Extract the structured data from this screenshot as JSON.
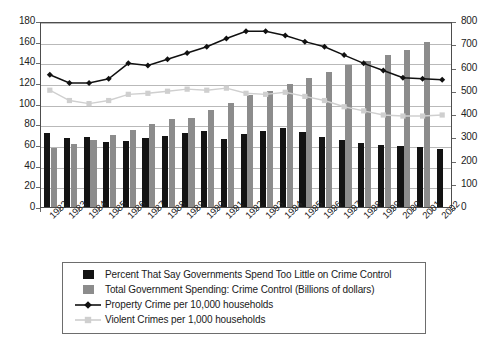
{
  "chart_data": {
    "type": "bar",
    "title": "",
    "subtitle": "",
    "xlabel": "",
    "ylabel": "",
    "grid": true,
    "legend_position": "bottom",
    "categories": [
      "1982",
      "1983",
      "1984",
      "1985",
      "1986",
      "1987",
      "1988",
      "1989",
      "1990",
      "1991",
      "1992",
      "1993",
      "1994",
      "1995",
      "1996",
      "1997",
      "1998",
      "1999",
      "2000",
      "2001",
      "2002"
    ],
    "axes": {
      "left": {
        "min": 0,
        "max": 180,
        "step": 20,
        "ticks": [
          "0",
          "20",
          "40",
          "60",
          "80",
          "100",
          "120",
          "140",
          "160",
          "180"
        ]
      },
      "right": {
        "min": 0,
        "max": 800,
        "step": 100,
        "ticks": [
          "0",
          "100",
          "200",
          "300",
          "400",
          "500",
          "600",
          "700",
          "800"
        ]
      }
    },
    "series": [
      {
        "name": "Percent That Say Governments Spend Too Little on Crime Control",
        "type": "bar",
        "axis": "left",
        "color": "#131313",
        "values": [
          72,
          67,
          68,
          63,
          64,
          67,
          69,
          72,
          74,
          66,
          71,
          74,
          76,
          73,
          68,
          65,
          62,
          60,
          59,
          58,
          56
        ]
      },
      {
        "name": "Total Government Spending: Crime Control (Billions of dollars)",
        "type": "bar",
        "axis": "left",
        "color": "#8c8c8c",
        "values": [
          57,
          61,
          65,
          70,
          75,
          80,
          85,
          86,
          94,
          101,
          108,
          112,
          119,
          125,
          131,
          137,
          141,
          147,
          152,
          160,
          0
        ]
      },
      {
        "name": "Property Crime per 10,000 households",
        "type": "line",
        "axis": "left",
        "color": "#111111",
        "marker": "diamond",
        "values": [
          129,
          121,
          121,
          125,
          140,
          138,
          144,
          150,
          156,
          164,
          171,
          171,
          167,
          161,
          156,
          148,
          140,
          133,
          126,
          125,
          124
        ]
      },
      {
        "name": "Violent Crimes per 1,000 households",
        "type": "line",
        "axis": "left",
        "color": "#cfcfcf",
        "marker": "square",
        "values": [
          114,
          104,
          101,
          104,
          110,
          111,
          113,
          115,
          114,
          116,
          111,
          110,
          112,
          108,
          104,
          98,
          94,
          90,
          89,
          89,
          90
        ]
      }
    ],
    "legend": [
      {
        "label": "Percent That Say Governments Spend Too Little on Crime Control",
        "key": "swatch-dark",
        "icon": "square-swatch-icon"
      },
      {
        "label": "Total Government Spending: Crime Control (Billions of dollars)",
        "key": "swatch-gray",
        "icon": "square-swatch-icon"
      },
      {
        "label": "Property Crime per 10,000 households",
        "key": "line-dark-diamond",
        "icon": "line-marker-diamond-icon"
      },
      {
        "label": "Violent Crimes per 1,000 households",
        "key": "line-light-square",
        "icon": "line-marker-square-icon"
      }
    ],
    "colors": {
      "bar_dark": "#131313",
      "bar_gray": "#8c8c8c",
      "line_dark": "#111111",
      "line_light": "#cfcfcf",
      "grid": "#b9b9b9",
      "frame": "#4d4d4d",
      "background": "#ffffff"
    }
  }
}
